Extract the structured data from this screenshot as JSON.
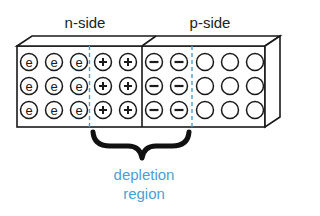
{
  "labels": {
    "n_side": "n-side",
    "p_side": "p-side",
    "depletion_line1": "depletion",
    "depletion_line2": "region"
  },
  "colors": {
    "outline": "#1a1a1a",
    "dashed_boundary": "#4a9fd4",
    "depletion_text": "#4a9fd4"
  },
  "grid": {
    "rows": 3,
    "columns": [
      {
        "x": 29,
        "type": "electron",
        "glyph": "e"
      },
      {
        "x": 54,
        "type": "electron",
        "glyph": "e"
      },
      {
        "x": 79,
        "type": "electron",
        "glyph": "e"
      },
      {
        "x": 103,
        "type": "positive-ion",
        "glyph": "+"
      },
      {
        "x": 128,
        "type": "positive-ion",
        "glyph": "+"
      },
      {
        "x": 154,
        "type": "negative-ion",
        "glyph": "−"
      },
      {
        "x": 179,
        "type": "negative-ion",
        "glyph": "−"
      },
      {
        "x": 205,
        "type": "hole",
        "glyph": ""
      },
      {
        "x": 230,
        "type": "hole",
        "glyph": ""
      },
      {
        "x": 255,
        "type": "hole",
        "glyph": ""
      }
    ],
    "row_y": [
      62,
      86,
      110
    ]
  }
}
